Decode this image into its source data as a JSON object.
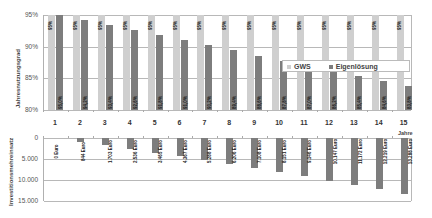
{
  "chart_data": [
    {
      "type": "bar",
      "title": "",
      "xlabel": "Jahre",
      "ylabel": "Jahresnutzungsgrad",
      "ylim": [
        80,
        95
      ],
      "yticks": [
        "80%",
        "85%",
        "90%",
        "95%"
      ],
      "grid": true,
      "legend_position": "inside-right",
      "categories": [
        "1",
        "2",
        "3",
        "4",
        "5",
        "6",
        "7",
        "8",
        "9",
        "10",
        "11",
        "12",
        "13",
        "14",
        "15"
      ],
      "series": [
        {
          "name": "GWS",
          "color": "#cfcfcf",
          "values": [
            95,
            95,
            95,
            95,
            95,
            95,
            95,
            95,
            95,
            95,
            95,
            95,
            95,
            95,
            95
          ],
          "labels": [
            "95%",
            "95%",
            "95%",
            "95%",
            "95%",
            "95%",
            "95%",
            "95%",
            "95%",
            "95%",
            "95%",
            "95%",
            "95%",
            "95%",
            "95%"
          ]
        },
        {
          "name": "Eigenlösung",
          "color": "#7d7d7d",
          "values": [
            95.0,
            94.2,
            93.4,
            92.6,
            91.8,
            91.0,
            90.2,
            89.4,
            88.6,
            87.8,
            87.0,
            86.2,
            85.4,
            84.6,
            83.8
          ],
          "labels": [
            "95,0%",
            "94,2%",
            "93,4%",
            "92,6%",
            "91,8%",
            "91,0%",
            "90,2%",
            "89,4%",
            "88,6%",
            "87,8%",
            "87,0%",
            "86,2%",
            "85,4%",
            "84,6%",
            "83,8%"
          ]
        }
      ]
    },
    {
      "type": "bar",
      "title": "",
      "xlabel": "Jahre",
      "ylabel": "Investitionsmehreinsatz",
      "ylim": [
        0,
        15000
      ],
      "inverted": true,
      "yticks": [
        "0",
        "5.000",
        "10.000",
        "15.000"
      ],
      "grid": true,
      "categories": [
        "1",
        "2",
        "3",
        "4",
        "5",
        "6",
        "7",
        "8",
        "9",
        "10",
        "11",
        "12",
        "13",
        "14",
        "15"
      ],
      "series": [
        {
          "name": "Investitionsmehreinsatz",
          "color": "#7d7d7d",
          "values": [
            0,
            844,
            1703,
            2536,
            3465,
            4367,
            5288,
            6206,
            7108,
            8151,
            9146,
            10147,
            11172,
            12219,
            13288
          ],
          "labels": [
            "0 Euro",
            "844 Euro",
            "1.703 Euro",
            "2.536 Euro",
            "3.465 Euro",
            "4.367 Euro",
            "5.288 Euro",
            "6.206 Euro",
            "7.108 Euro",
            "8.151 Euro",
            "9.146 Euro",
            "10.147 Euro",
            "11.172 Euro",
            "12.219 Euro",
            "13.288 Euro"
          ]
        }
      ]
    }
  ],
  "top": {
    "ylabel": "Jahresnutzungsgrad",
    "yticks": [
      "95%",
      "90%",
      "85%",
      "80%"
    ],
    "legend": {
      "gws": "GWS",
      "eig": "Eigenlösung"
    }
  },
  "bottom": {
    "ylabel": "Investitionsmehreinsatz",
    "yticks": [
      "0",
      "5.000",
      "10.000",
      "15.000"
    ]
  },
  "xaxis": {
    "unit_label": "Jahre"
  }
}
